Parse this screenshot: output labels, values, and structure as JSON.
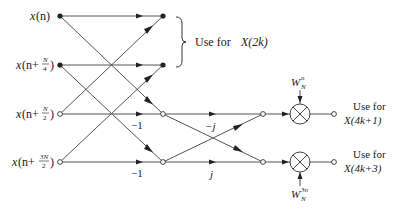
{
  "diagram": {
    "type": "signal-flow-graph",
    "inputs": [
      {
        "id": "x0",
        "label_main": "x",
        "label_arg": "(n)",
        "node": "filled"
      },
      {
        "id": "x1",
        "label_main": "x",
        "label_arg": "(n+",
        "frac_num": "N",
        "frac_den": "4",
        "label_close": ")",
        "node": "filled"
      },
      {
        "id": "x2",
        "label_main": "x",
        "label_arg": "(n+",
        "frac_num": "N",
        "frac_den": "2",
        "label_close": ")",
        "node": "hollow"
      },
      {
        "id": "x3",
        "label_main": "x",
        "label_arg": "(n+",
        "frac_num": "3N",
        "frac_den": "2",
        "label_close": ")",
        "node": "hollow"
      }
    ],
    "branch_gains": {
      "g1": "−1",
      "g2": "−1",
      "g3": "−j",
      "g4": "j"
    },
    "twiddles": {
      "top": {
        "base": "W",
        "sub": "N",
        "sup": "n"
      },
      "bottom": {
        "base": "W",
        "sub": "N",
        "sup": "3n"
      }
    },
    "outputs": {
      "even": {
        "line1": "Use for",
        "line2": "X(2k)"
      },
      "odd1": {
        "line1": "Use for",
        "line2": "X(4k+1)"
      },
      "odd3": {
        "line1": "Use for",
        "line2": "X(4k+3)"
      }
    },
    "colors": {
      "line": "#555555",
      "node": "#222222",
      "text": "#222222"
    }
  }
}
